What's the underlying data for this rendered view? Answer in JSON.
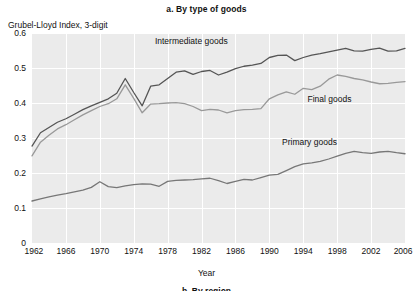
{
  "chart_data": {
    "type": "line",
    "title": "a. By type of goods",
    "ylabel": "Grubel-Lloyd Index, 3-digit",
    "xlabel": "Year",
    "grid": true,
    "legend_position": "inline-annotations",
    "xlim": [
      1962,
      2006
    ],
    "ylim": [
      0,
      0.6
    ],
    "ytick_labels": [
      "0.6",
      "0.5",
      "0.4",
      "0.3",
      "0.2",
      "0.1",
      "0"
    ],
    "ytick_values": [
      0.6,
      0.5,
      0.4,
      0.3,
      0.2,
      0.1,
      0
    ],
    "xtick_labels": [
      "1962",
      "1966",
      "1970",
      "1974",
      "1978",
      "1982",
      "1986",
      "1990",
      "1994",
      "1998",
      "2002",
      "2006"
    ],
    "xtick_values": [
      1962,
      1966,
      1970,
      1974,
      1978,
      1982,
      1986,
      1990,
      1994,
      1998,
      2002,
      2006
    ],
    "x": [
      1962,
      1963,
      1964,
      1965,
      1966,
      1967,
      1968,
      1969,
      1970,
      1971,
      1972,
      1973,
      1974,
      1975,
      1976,
      1977,
      1978,
      1979,
      1980,
      1981,
      1982,
      1983,
      1984,
      1985,
      1986,
      1987,
      1988,
      1989,
      1990,
      1991,
      1992,
      1993,
      1994,
      1995,
      1996,
      1997,
      1998,
      1999,
      2000,
      2001,
      2002,
      2003,
      2004,
      2005,
      2006
    ],
    "series": [
      {
        "name": "Intermediate goods",
        "color": "#555555",
        "label_x": 1976.5,
        "label_y": 0.575,
        "values": [
          0.277,
          0.315,
          0.33,
          0.345,
          0.355,
          0.368,
          0.381,
          0.392,
          0.402,
          0.412,
          0.428,
          0.47,
          0.43,
          0.392,
          0.448,
          0.452,
          0.47,
          0.488,
          0.492,
          0.482,
          0.49,
          0.493,
          0.48,
          0.488,
          0.498,
          0.505,
          0.508,
          0.513,
          0.53,
          0.536,
          0.537,
          0.521,
          0.53,
          0.537,
          0.541,
          0.546,
          0.551,
          0.556,
          0.549,
          0.548,
          0.553,
          0.557,
          0.548,
          0.549,
          0.556
        ]
      },
      {
        "name": "Final goods",
        "color": "#999999",
        "label_x": 1994.5,
        "label_y": 0.408,
        "values": [
          0.249,
          0.288,
          0.308,
          0.326,
          0.338,
          0.352,
          0.366,
          0.378,
          0.39,
          0.398,
          0.412,
          0.452,
          0.413,
          0.372,
          0.397,
          0.398,
          0.4,
          0.401,
          0.398,
          0.39,
          0.378,
          0.382,
          0.38,
          0.372,
          0.378,
          0.381,
          0.382,
          0.384,
          0.412,
          0.423,
          0.432,
          0.425,
          0.442,
          0.438,
          0.448,
          0.468,
          0.48,
          0.476,
          0.47,
          0.466,
          0.46,
          0.455,
          0.456,
          0.459,
          0.461
        ]
      },
      {
        "name": "Primary goods",
        "color": "#777777",
        "label_x": 1991.5,
        "label_y": 0.286,
        "values": [
          0.12,
          0.126,
          0.132,
          0.137,
          0.141,
          0.146,
          0.151,
          0.159,
          0.175,
          0.161,
          0.158,
          0.163,
          0.167,
          0.169,
          0.168,
          0.162,
          0.176,
          0.179,
          0.18,
          0.181,
          0.183,
          0.185,
          0.178,
          0.17,
          0.176,
          0.182,
          0.18,
          0.187,
          0.194,
          0.196,
          0.207,
          0.218,
          0.226,
          0.229,
          0.233,
          0.24,
          0.248,
          0.256,
          0.262,
          0.258,
          0.256,
          0.26,
          0.262,
          0.258,
          0.255
        ]
      }
    ]
  },
  "clipped_caption": "b. By region"
}
